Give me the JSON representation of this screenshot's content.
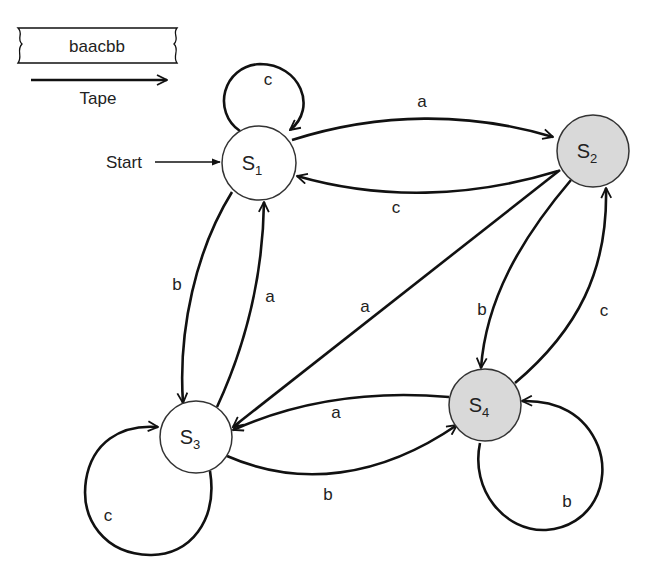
{
  "tape": {
    "content": "baacbb",
    "label": "Tape"
  },
  "start_label": "Start",
  "colors": {
    "accepting_fill": "#d9d9d9",
    "normal_fill": "#ffffff",
    "stroke": "#111111"
  },
  "states": [
    {
      "id": "S1",
      "letter": "S",
      "index": "1",
      "start": true,
      "accepting": false
    },
    {
      "id": "S2",
      "letter": "S",
      "index": "2",
      "start": false,
      "accepting": true
    },
    {
      "id": "S3",
      "letter": "S",
      "index": "3",
      "start": false,
      "accepting": false
    },
    {
      "id": "S4",
      "letter": "S",
      "index": "4",
      "start": false,
      "accepting": true
    }
  ],
  "transitions": [
    {
      "from": "S1",
      "to": "S1",
      "symbol": "c"
    },
    {
      "from": "S1",
      "to": "S2",
      "symbol": "a"
    },
    {
      "from": "S2",
      "to": "S1",
      "symbol": "c"
    },
    {
      "from": "S1",
      "to": "S3",
      "symbol": "b"
    },
    {
      "from": "S3",
      "to": "S1",
      "symbol": "a"
    },
    {
      "from": "S2",
      "to": "S3",
      "symbol": "a"
    },
    {
      "from": "S2",
      "to": "S4",
      "symbol": "b"
    },
    {
      "from": "S4",
      "to": "S2",
      "symbol": "c"
    },
    {
      "from": "S4",
      "to": "S3",
      "symbol": "a"
    },
    {
      "from": "S3",
      "to": "S4",
      "symbol": "b"
    },
    {
      "from": "S3",
      "to": "S3",
      "symbol": "c"
    },
    {
      "from": "S4",
      "to": "S4",
      "symbol": "b"
    }
  ]
}
